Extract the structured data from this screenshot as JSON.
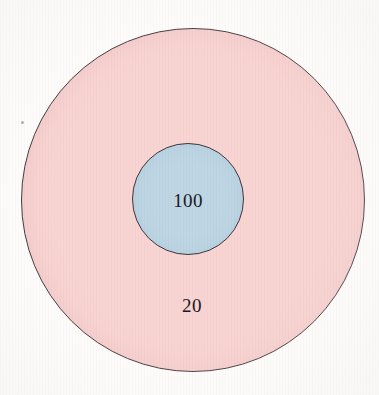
{
  "figure": {
    "type": "venn-concentric",
    "background_color": "#fdfcfb",
    "width": 379,
    "height": 395
  },
  "chart_data": {
    "type": "pie",
    "title": "",
    "xlabel": "",
    "ylabel": "",
    "categories": [
      "outer region",
      "inner region"
    ],
    "values": [
      20,
      100
    ],
    "labels": [
      "20",
      "100"
    ],
    "shapes": [
      {
        "name": "outer-circle",
        "label": "20",
        "value": 20,
        "fill": "#f8d4d2",
        "stroke": "#463a3e",
        "center_x": 193,
        "center_y": 200,
        "radius": 172
      },
      {
        "name": "inner-circle",
        "label": "100",
        "value": 100,
        "fill": "#bfd6e4",
        "stroke": "#403539",
        "center_x": 188,
        "center_y": 199,
        "radius": 56
      }
    ],
    "legend": "none",
    "grid": false
  },
  "outer_region": {
    "label": "20",
    "fill_color": "#f8d4d2",
    "stroke_color": "#463a3e"
  },
  "inner_region": {
    "label": "100",
    "fill_color": "#bfd6e4",
    "stroke_color": "#403539"
  },
  "artifacts": {
    "speck_label": ""
  }
}
